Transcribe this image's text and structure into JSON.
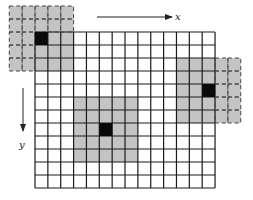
{
  "diagram": {
    "grid": {
      "origin_x": 35,
      "origin_y": 32,
      "cell_w": 12.86,
      "cell_h": 13.0,
      "cols": 14,
      "rows": 12,
      "line_color": "#1a1a1a",
      "background": "#ffffff"
    },
    "window_size": 5,
    "window_fill": "#c4c4c4",
    "center_fill": "#0a0a0a",
    "windows": [
      {
        "name": "top-left-window",
        "center_col": 0,
        "center_row": 0
      },
      {
        "name": "right-window",
        "center_col": 13,
        "center_row": 4
      },
      {
        "name": "middle-window",
        "center_col": 5,
        "center_row": 7
      }
    ],
    "axes": {
      "x": {
        "label": "x",
        "x1": 97,
        "y1": 17,
        "x2": 172,
        "y2": 17,
        "label_x": 175,
        "label_y": 20
      },
      "y": {
        "label": "y",
        "x1": 23,
        "y1": 88,
        "x2": 23,
        "y2": 131,
        "label_x": 19,
        "label_y": 148
      }
    }
  }
}
